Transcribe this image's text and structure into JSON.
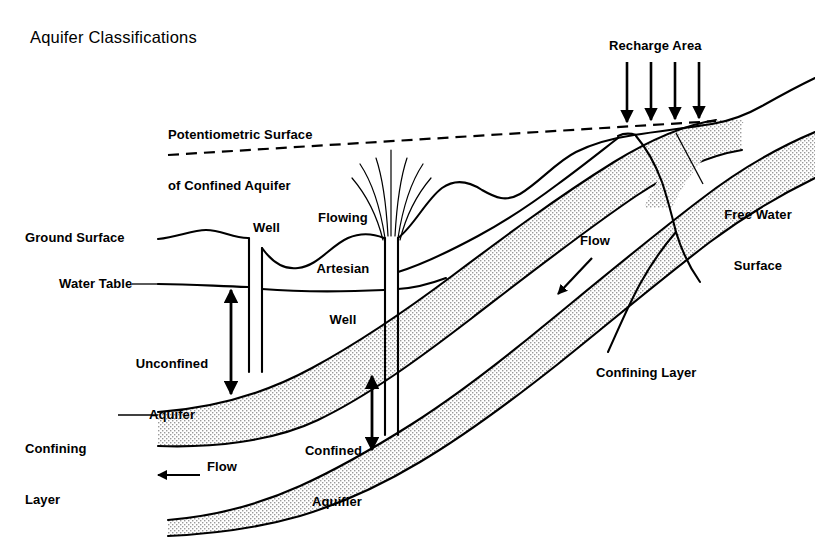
{
  "figure": {
    "title": "Aquifer Classifications",
    "type": "hydrogeology-cross-section",
    "background_color": "#ffffff",
    "line_color": "#000000",
    "stipple_color": "#b4b4b4"
  },
  "labels": {
    "potentiometric_line1": "Potentiometric Surface",
    "potentiometric_line2": "of Confined Aquifer",
    "recharge_area": "Recharge Area",
    "free_water_line1": "Free Water",
    "free_water_line2": "Surface",
    "flowing_artesian_line1": "Flowing",
    "flowing_artesian_line2": "Artesian",
    "flowing_artesian_line3": "Well",
    "well": "Well",
    "ground_surface": "Ground Surface",
    "water_table": "Water Table",
    "unconfined_line1": "Unconfined",
    "unconfined_line2": "Aquifer",
    "confining_left_line1": "Confining",
    "confining_left_line2": "Layer",
    "confined_line1": "Confined",
    "confined_line2": "Aquifier",
    "confining_right": "Confining Layer",
    "flow_right": "Flow",
    "flow_left": "Flow"
  },
  "features": {
    "recharge_arrow_count": 4,
    "artesian_spray_streams": 7,
    "well_count": 2,
    "confining_layer_count": 2,
    "potentiometric_surface_style": "dashed",
    "unconfined_depth_arrow": "double-headed",
    "confined_depth_arrow": "double-headed",
    "flow_right_direction": "down-left",
    "flow_left_direction": "left"
  }
}
